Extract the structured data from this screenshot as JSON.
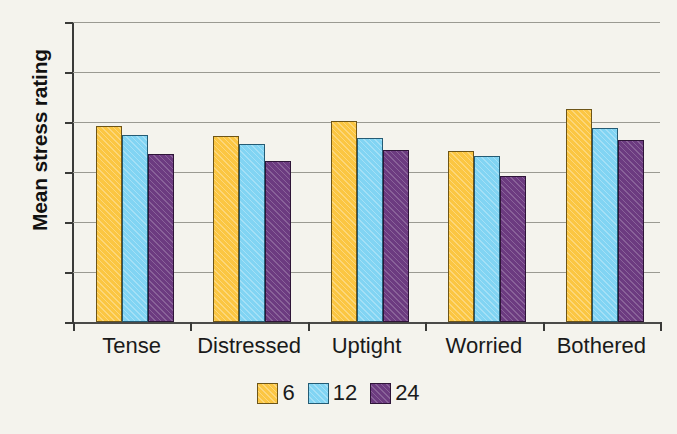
{
  "chart_data": {
    "type": "bar",
    "title": "",
    "xlabel": "",
    "ylabel": "Mean stress rating",
    "categories": [
      "Tense",
      "Distressed",
      "Uptight",
      "Worried",
      "Bothered"
    ],
    "series": [
      {
        "name": "6",
        "values": [
          4.93,
          4.73,
          5.03,
          4.43,
          5.27
        ]
      },
      {
        "name": "12",
        "values": [
          4.74,
          4.56,
          4.69,
          4.32,
          4.89
        ]
      },
      {
        "name": "24",
        "values": [
          4.36,
          4.22,
          4.45,
          3.93,
          4.64
        ]
      }
    ],
    "ylim": [
      1,
      7
    ],
    "yticks": [
      1,
      2,
      3,
      4,
      5,
      6,
      7
    ],
    "ytick_labels": [
      "1",
      "2",
      "3",
      "4",
      "5",
      "6",
      "7"
    ],
    "grid": true,
    "legend_position": "bottom",
    "colors": {
      "series_6": "#fbc642",
      "series_12": "#81d4f3",
      "series_24": "#6c3b80",
      "background": "#f4f3ed",
      "axis": "#3a3a38",
      "gridline": "#9a9a92",
      "text": "#1a1a1a"
    }
  },
  "legend": {
    "entries": [
      {
        "label": "6"
      },
      {
        "label": "12"
      },
      {
        "label": "24"
      }
    ]
  }
}
